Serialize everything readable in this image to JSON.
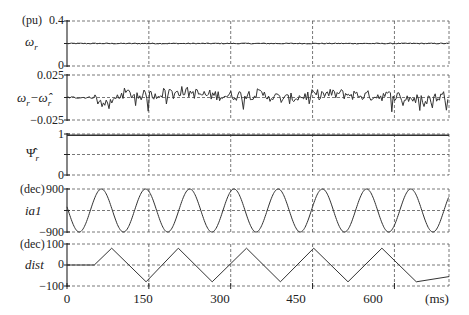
{
  "chart_data": [
    {
      "type": "line",
      "name": "omega_r",
      "ylabel": "ωr",
      "unit": "(pu)",
      "yticks": [
        "0",
        "0.4"
      ],
      "ylim": [
        0,
        0.4
      ],
      "grid": true,
      "description": "Rotor speed, nearly constant ~0.2 pu with small ripple",
      "x": [
        0,
        100,
        200,
        300,
        400,
        500,
        600,
        700
      ],
      "values": [
        0.2,
        0.2,
        0.2,
        0.2,
        0.2,
        0.2,
        0.2,
        0.2
      ]
    },
    {
      "type": "line",
      "name": "speed_error",
      "ylabel": "ωr−ω̂r",
      "unit": "",
      "yticks": [
        "-0.025",
        "0.025"
      ],
      "ylim": [
        -0.025,
        0.025
      ],
      "grid": true,
      "description": "Speed estimation error, noisy around 0 within about ±0.015",
      "x": [
        0,
        50,
        75,
        100,
        150,
        200,
        250,
        300,
        350,
        400,
        450,
        500,
        550,
        600,
        650,
        700
      ],
      "values": [
        0,
        0,
        -0.01,
        0.005,
        0.002,
        0.008,
        0.003,
        0.002,
        0.004,
        -0.002,
        0.003,
        0.004,
        0.002,
        0.002,
        -0.003,
        0.003
      ]
    },
    {
      "type": "line",
      "name": "psi_r_hat",
      "ylabel": "Ψ̂r",
      "unit": "",
      "yticks": [
        "0",
        "1"
      ],
      "ylim": [
        0,
        1
      ],
      "grid": true,
      "description": "Estimated rotor flux, constant ~0.97",
      "x": [
        0,
        700
      ],
      "values": [
        0.97,
        0.97
      ]
    },
    {
      "type": "line",
      "name": "ia1",
      "ylabel": "ia1",
      "unit": "(dec)",
      "yticks": [
        "-900",
        "900"
      ],
      "ylim": [
        -900,
        900
      ],
      "grid": true,
      "description": "Phase current, sinusoid amplitude ~900 dec, period ~81 ms",
      "amplitude": 900,
      "period_ms": 81,
      "first_peak_ms": 63
    },
    {
      "type": "line",
      "name": "dist",
      "ylabel": "dist",
      "unit": "(dec)",
      "yticks": [
        "-100",
        "0",
        "100"
      ],
      "ylim": [
        -100,
        100
      ],
      "grid": true,
      "description": "Disturbance: zero until ~50 ms, then triangular wave ±80",
      "x": [
        0,
        50,
        82,
        145,
        204,
        266,
        329,
        391,
        452,
        515,
        577,
        640,
        700
      ],
      "values": [
        0,
        0,
        80,
        -80,
        80,
        -80,
        80,
        -80,
        80,
        -80,
        80,
        -80,
        -55
      ]
    }
  ],
  "xaxis": {
    "ticks": [
      "0",
      "150",
      "300",
      "450",
      "600"
    ],
    "tick_values": [
      0,
      150,
      300,
      450,
      600
    ],
    "unit": "(ms)",
    "xlim": [
      0,
      700
    ]
  },
  "labels": {
    "unit_pu": "(pu)",
    "unit_dec_1": "(dec)",
    "unit_dec_2": "(dec)",
    "p1_top": "0.4",
    "p1_bot": "0",
    "p2_top": "0.025",
    "p2_bot": "−0.025",
    "p3_top": "1",
    "p3_bot": "0",
    "p4_top": "900",
    "p4_bot": "−900",
    "p5_top": "100",
    "p5_mid": "0",
    "p5_bot": "−100",
    "x0": "0",
    "x150": "150",
    "x300": "300",
    "x450": "450",
    "x600": "600",
    "x_unit": "(ms)",
    "name_omega": "ω",
    "name_omega_sub": "r",
    "name_err": "ω",
    "name_err_sub": "r",
    "name_err_minus": "−",
    "name_err_hat": "ω̂",
    "name_err_hat_sub": "r",
    "name_psi": "Ψ̂",
    "name_psi_sub": "r",
    "name_ia1": "ia1",
    "name_dist": "dist"
  }
}
